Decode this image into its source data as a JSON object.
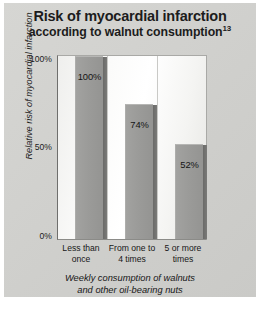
{
  "figure": {
    "title_line1": "Risk of myocardial infarction",
    "title_line2": "according to walnut consumption",
    "title_superscript": "13",
    "background_color": "#d2d2cf",
    "bar_color": "#9b9b99",
    "text_color": "#1c1c1c"
  },
  "axis": {
    "y_title": "Relative risk of myocardial infarction",
    "y_ticks": [
      "100%",
      "50%",
      "0%"
    ],
    "x_caption_line1": "Weekly consumption of walnuts",
    "x_caption_line2": "and other oil-bearing nuts"
  },
  "chart_data": {
    "type": "bar",
    "title": "Risk of myocardial infarction according to walnut consumption",
    "categories": [
      "Less than once",
      "From one to 4 times",
      "5 or more times"
    ],
    "category_lines": [
      [
        "Less than",
        "once"
      ],
      [
        "From one to",
        "4 times"
      ],
      [
        "5 or more",
        "times"
      ]
    ],
    "values": [
      100,
      74,
      52
    ],
    "value_labels": [
      "100%",
      "74%",
      "52%"
    ],
    "xlabel": "Weekly consumption of walnuts and other oil-bearing nuts",
    "ylabel": "Relative risk of myocardial infarction",
    "ylim": [
      0,
      100
    ],
    "yticks": [
      0,
      50,
      100
    ],
    "ytick_labels": [
      "0%",
      "50%",
      "100%"
    ],
    "grid": false,
    "legend": false,
    "footnote_ref": "13"
  }
}
